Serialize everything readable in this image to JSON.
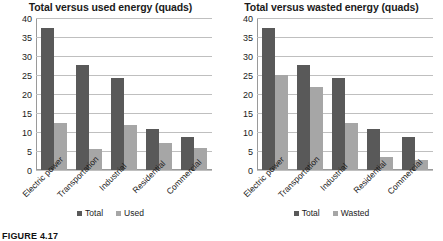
{
  "caption": "FIGURE 4.17",
  "colors": {
    "series_total": "#595959",
    "series_secondary": "#a6a6a6",
    "gridline": "#bfbfbf",
    "axis": "#9a9a9a",
    "text": "#1b1b1b",
    "background": "#ffffff"
  },
  "chart_data": [
    {
      "type": "bar",
      "title": "Total versus used energy (quads)",
      "xlabel": "",
      "ylabel": "",
      "ylim": [
        0,
        40
      ],
      "yticks": [
        0,
        5,
        10,
        15,
        20,
        25,
        30,
        35,
        40
      ],
      "ytick_labels": [
        "0",
        "5",
        "10",
        "15",
        "20",
        "25",
        "30",
        "35",
        "40"
      ],
      "grid": true,
      "legend_position": "bottom",
      "categories": [
        "Electric power",
        "Transportation",
        "Industrial",
        "Residential",
        "Commercial"
      ],
      "series": [
        {
          "name": "Total",
          "color": "#595959",
          "values": [
            37.4,
            27.7,
            24.3,
            10.9,
            8.8
          ]
        },
        {
          "name": "Used",
          "color": "#a6a6a6",
          "values": [
            12.4,
            5.6,
            11.8,
            7.0,
            5.7
          ]
        }
      ]
    },
    {
      "type": "bar",
      "title": "Total versus wasted energy (quads)",
      "xlabel": "",
      "ylabel": "",
      "ylim": [
        0,
        40
      ],
      "yticks": [
        0,
        5,
        10,
        15,
        20,
        25,
        30,
        35,
        40
      ],
      "ytick_labels": [
        "0",
        "5",
        "10",
        "15",
        "20",
        "25",
        "30",
        "35",
        "40"
      ],
      "grid": true,
      "legend_position": "bottom",
      "categories": [
        "Electric power",
        "Transportation",
        "Industrial",
        "Residential",
        "Commercial"
      ],
      "series": [
        {
          "name": "Total",
          "color": "#595959",
          "values": [
            37.4,
            27.7,
            24.3,
            10.9,
            8.8
          ]
        },
        {
          "name": "Wasted",
          "color": "#a6a6a6",
          "values": [
            25.0,
            21.8,
            12.3,
            3.5,
            2.7
          ]
        }
      ]
    }
  ]
}
